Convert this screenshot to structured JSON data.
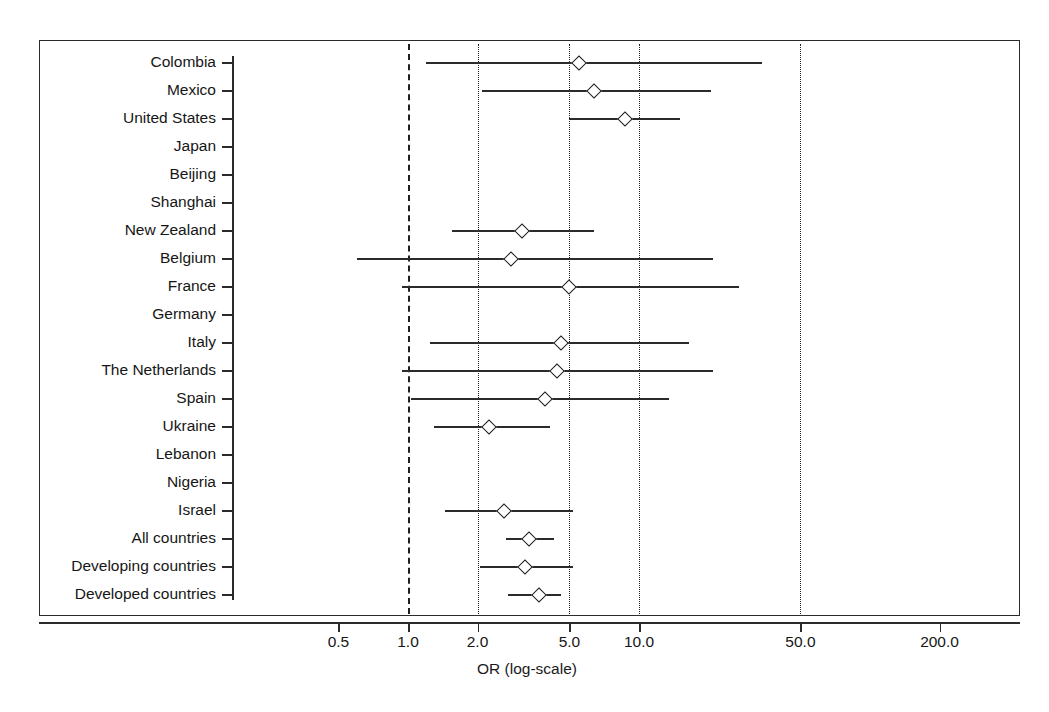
{
  "chart_data": {
    "type": "scatter",
    "subtype": "forest-plot",
    "title": "",
    "xlabel": "OR (log-scale)",
    "ylabel": "",
    "xscale": "log",
    "xlim": [
      0.35,
      260
    ],
    "grid": false,
    "legend": null,
    "reference_lines": [
      {
        "value": 1.0,
        "style": "dashed"
      },
      {
        "value": 2.0,
        "style": "dotted"
      },
      {
        "value": 5.0,
        "style": "dotted"
      },
      {
        "value": 10.0,
        "style": "dotted"
      },
      {
        "value": 50.0,
        "style": "dotted"
      }
    ],
    "xticks": [
      {
        "value": 0.5,
        "label": "0.5"
      },
      {
        "value": 1.0,
        "label": "1.0"
      },
      {
        "value": 2.0,
        "label": "2.0"
      },
      {
        "value": 5.0,
        "label": "5.0"
      },
      {
        "value": 10.0,
        "label": "10.0"
      },
      {
        "value": 50.0,
        "label": "50.0"
      },
      {
        "value": 200.0,
        "label": "200.0"
      }
    ],
    "categories": [
      "Colombia",
      "Mexico",
      "United States",
      "Japan",
      "Beijing",
      "Shanghai",
      "New Zealand",
      "Belgium",
      "France",
      "Germany",
      "Italy",
      "The Netherlands",
      "Spain",
      "Ukraine",
      "Lebanon",
      "Nigeria",
      "Israel",
      "All countries",
      "Developing countries",
      "Developed countries"
    ],
    "rows": [
      {
        "label": "Colombia",
        "or": 5.5,
        "lo": 1.2,
        "hi": 34.0
      },
      {
        "label": "Mexico",
        "or": 6.4,
        "lo": 2.1,
        "hi": 20.5
      },
      {
        "label": "United States",
        "or": 8.7,
        "lo": 5.0,
        "hi": 15.0
      },
      {
        "label": "Japan",
        "or": null,
        "lo": null,
        "hi": null
      },
      {
        "label": "Beijing",
        "or": null,
        "lo": null,
        "hi": null
      },
      {
        "label": "Shanghai",
        "or": null,
        "lo": null,
        "hi": null
      },
      {
        "label": "New Zealand",
        "or": 3.1,
        "lo": 1.55,
        "hi": 6.4
      },
      {
        "label": "Belgium",
        "or": 2.8,
        "lo": 0.6,
        "hi": 21.0
      },
      {
        "label": "France",
        "or": 5.0,
        "lo": 0.94,
        "hi": 27.0
      },
      {
        "label": "Germany",
        "or": null,
        "lo": null,
        "hi": null
      },
      {
        "label": "Italy",
        "or": 4.6,
        "lo": 1.25,
        "hi": 16.5
      },
      {
        "label": "The Netherlands",
        "or": 4.4,
        "lo": 0.94,
        "hi": 21.0
      },
      {
        "label": "Spain",
        "or": 3.9,
        "lo": 1.03,
        "hi": 13.5
      },
      {
        "label": "Ukraine",
        "or": 2.25,
        "lo": 1.3,
        "hi": 4.1
      },
      {
        "label": "Lebanon",
        "or": null,
        "lo": null,
        "hi": null
      },
      {
        "label": "Nigeria",
        "or": null,
        "lo": null,
        "hi": null
      },
      {
        "label": "Israel",
        "or": 2.6,
        "lo": 1.45,
        "hi": 5.2
      },
      {
        "label": "All countries",
        "or": 3.35,
        "lo": 2.65,
        "hi": 4.3
      },
      {
        "label": "Developing countries",
        "or": 3.2,
        "lo": 2.05,
        "hi": 5.2
      },
      {
        "label": "Developed countries",
        "or": 3.7,
        "lo": 2.7,
        "hi": 4.6
      }
    ]
  }
}
